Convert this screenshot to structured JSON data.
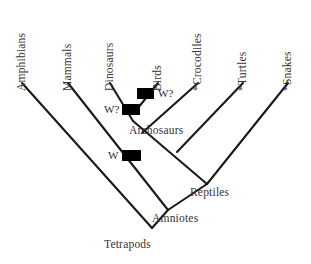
{
  "diagram": {
    "type": "cladogram",
    "title": "",
    "background_color": "#ffffff",
    "line_color": "#1a1a1a",
    "text_color": "#333333",
    "marker_color": "#000000"
  },
  "tip_taxa": [
    {
      "label": "Amphibians",
      "x": 22,
      "y": 82,
      "tip_x": 22,
      "tip_y": 83
    },
    {
      "label": "Mammals",
      "x": 68,
      "y": 82,
      "tip_x": 68,
      "tip_y": 83
    },
    {
      "label": "Dinosaurs",
      "x": 110,
      "y": 82,
      "tip_x": 110,
      "tip_y": 83
    },
    {
      "label": "Birds",
      "x": 158,
      "y": 82,
      "tip_x": 158,
      "tip_y": 83
    },
    {
      "label": "*Crocodiles",
      "x": 198,
      "y": 82,
      "tip_x": 198,
      "tip_y": 83
    },
    {
      "label": "*Turtles",
      "x": 243,
      "y": 82,
      "tip_x": 243,
      "tip_y": 83
    },
    {
      "label": "*Snakes",
      "x": 288,
      "y": 82,
      "tip_x": 288,
      "tip_y": 83
    }
  ],
  "internal_nodes": [
    {
      "label": "Archosaurs",
      "x": 133,
      "y": 121,
      "label_x": 129,
      "label_y": 124
    },
    {
      "label": "Reptiles",
      "x": 207,
      "y": 184,
      "label_x": 190,
      "label_y": 186
    },
    {
      "label": "Amniotes",
      "x": 168,
      "y": 210,
      "label_x": 152,
      "label_y": 212
    },
    {
      "label": "Tetrapods",
      "x": 152,
      "y": 228,
      "label_x": 104,
      "label_y": 238
    }
  ],
  "event_markers": [
    {
      "label": "W?",
      "marker_x": 146,
      "marker_y": 94,
      "label_x": 158,
      "label_y": 90
    },
    {
      "label": "W?",
      "marker_x": 131,
      "marker_y": 110,
      "label_x": 108,
      "label_y": 106
    },
    {
      "label": "W",
      "marker_x": 131,
      "marker_y": 156,
      "label_x": 112,
      "label_y": 151
    }
  ],
  "legend_note": {
    "asterisk_meaning": "*"
  }
}
